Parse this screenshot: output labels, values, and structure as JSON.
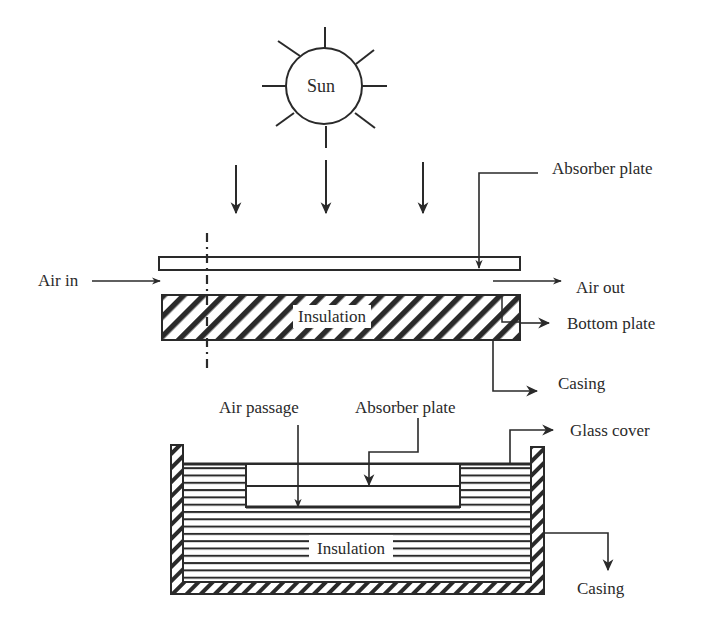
{
  "diagram": {
    "type": "solar air heater schematic",
    "colors": {
      "ink": "#2a2a2a",
      "background": "#ffffff"
    },
    "top_view": {
      "sun_label": "Sun",
      "labels": {
        "absorber_plate": "Absorber plate",
        "air_in": "Air in",
        "air_out": "Air out",
        "insulation": "Insulation",
        "bottom_plate": "Bottom plate",
        "casing": "Casing"
      },
      "sunlight_arrows": 3
    },
    "cross_section": {
      "labels": {
        "air_passage": "Air passage",
        "absorber_plate": "Absorber plate",
        "glass_cover": "Glass cover",
        "insulation": "Insulation",
        "casing": "Casing"
      }
    }
  }
}
